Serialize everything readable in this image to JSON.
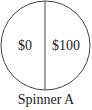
{
  "spinner": {
    "title": "Spinner A",
    "sections": [
      {
        "label": "$0",
        "position": "left"
      },
      {
        "label": "$100",
        "position": "right"
      }
    ],
    "stroke_color": "#444444",
    "text_color": "#222222"
  }
}
